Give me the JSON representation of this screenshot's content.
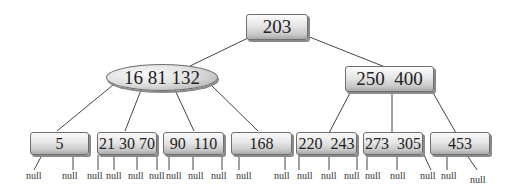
{
  "diagram": {
    "type": "B-tree",
    "root": {
      "keys": "203"
    },
    "internal": [
      {
        "id": "left",
        "keys": "16 81 132",
        "shape": "ellipse"
      },
      {
        "id": "right",
        "keys": "250  400",
        "shape": "rect"
      }
    ],
    "leaves": [
      {
        "keys": "5"
      },
      {
        "keys": "21 30 70"
      },
      {
        "keys": "90  110"
      },
      {
        "keys": "168"
      },
      {
        "keys": "220  243"
      },
      {
        "keys": "273  305"
      },
      {
        "keys": "453"
      }
    ],
    "null_label": "null",
    "nulls": [
      "null",
      "null",
      "null",
      "null",
      "null",
      "null",
      "null",
      "null",
      "null",
      "null",
      "null",
      "null",
      "null",
      "null",
      "null",
      "null",
      "null",
      "null"
    ]
  }
}
